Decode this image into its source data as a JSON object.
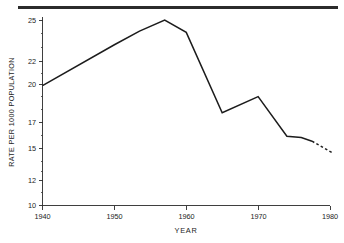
{
  "chart_data": {
    "type": "line",
    "title": "",
    "xlabel": "YEAR",
    "ylabel": "RATE PER 1000 POPULATION",
    "xlim": [
      1940,
      1980
    ],
    "ylim": [
      10,
      25.8
    ],
    "grid": false,
    "legend": null,
    "xticks": [
      1940,
      1950,
      1960,
      1970,
      1980
    ],
    "xtick_labels": [
      "1940",
      "1950",
      "1960",
      "1970",
      "1980"
    ],
    "yticks": [
      10,
      12,
      15,
      17,
      20,
      22,
      25
    ],
    "ytick_labels": [
      "10",
      "12",
      "15",
      "17",
      "20",
      "22",
      "25"
    ],
    "yminor_ticks": [
      11,
      13,
      14,
      16,
      18,
      19,
      21,
      23,
      24
    ],
    "series": [
      {
        "name": "Birth rate",
        "style": "solid",
        "x": [
          1940,
          1950,
          1953.5,
          1957,
          1960,
          1965,
          1970,
          1974,
          1976,
          1977.5
        ],
        "values": [
          19.7,
          23.0,
          24.1,
          25.0,
          24.0,
          17.5,
          18.8,
          15.6,
          15.5,
          15.2
        ]
      },
      {
        "name": "Birth rate (projected)",
        "style": "dashed",
        "x": [
          1977.5,
          1980.5
        ],
        "values": [
          15.2,
          14.2
        ]
      }
    ]
  },
  "figure": {
    "top_rule": "horizontal-rule",
    "background_color": "#ffffff",
    "line_color": "#1c1c1c",
    "axis_color": "#2a2a2a"
  }
}
